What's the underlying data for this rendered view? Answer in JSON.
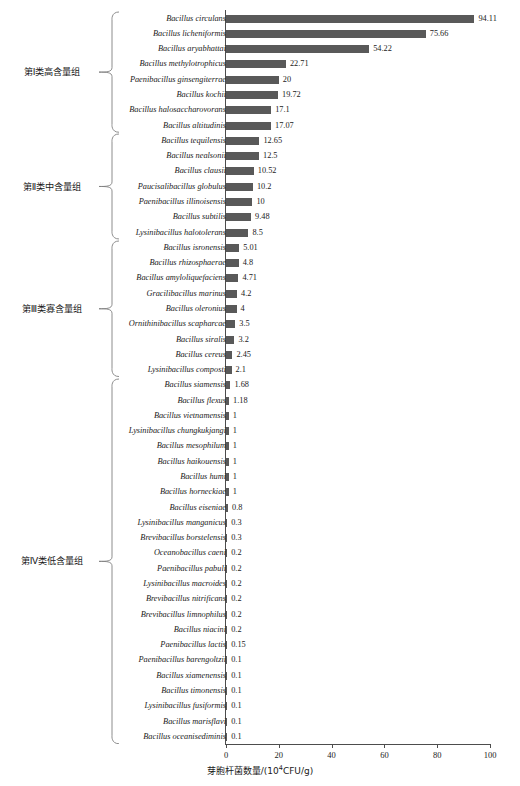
{
  "chart_data": {
    "type": "bar",
    "orientation": "horizontal",
    "title": "",
    "xlabel": "芽胞杆菌数量/(10⁴CFU/g)",
    "ylabel": "",
    "xlim": [
      0,
      100
    ],
    "xticks": [
      0,
      20,
      40,
      60,
      80,
      100
    ],
    "xtick_labels": [
      "0",
      "20",
      "40",
      "60",
      "80",
      "100"
    ],
    "grid": false,
    "legend": false,
    "bar_color": "#595959",
    "axis_color": "#4d4d4d",
    "categories": [
      "Bacillus circulans",
      "Bacillus licheniformis",
      "Bacillus aryabhattai",
      "Bacillus methylotrophicus",
      "Paenibacillus ginsengiterrae",
      "Bacillus kochii",
      "Bacillus halosaccharovorans",
      "Bacillus altitudinis",
      "Bacillus tequilensis",
      "Bacillus nealsonii",
      "Bacillus clausii",
      "Paucisalibacillus globulus",
      "Paenibacillus illinoisensis",
      "Bacillus subtilis",
      "Lysinibacillus halotolerans",
      "Bacillus isronensis",
      "Bacillus rhizosphaerae",
      "Bacillus amyloliquefaciens",
      "Gracilibacillus marinus",
      "Bacillus oleronius",
      "Ornithinibacillus scapharcae",
      "Bacillus siralis",
      "Bacillus cereus",
      "Lysinibacillus composti",
      "Bacillus siamensis",
      "Bacillus flexus",
      "Bacillus vietnamensis",
      "Lysinibacillus chungkukjangi",
      "Bacillus mesophilum",
      "Bacillus haikouensis",
      "Bacillus humi",
      "Bacillus horneckiae",
      "Bacillus eiseniae",
      "Lysinibacillus manganicus",
      "Brevibacillus borstelensis",
      "Oceanobacillus caeni",
      "Paenibacillus pabuli",
      "Lysinibacillus macroides",
      "Brevibacillus nitrificans",
      "Brevibacillus limnophilus",
      "Bacillus niacini",
      "Paenibacillus lactis",
      "Paenibacillus barengoltzii",
      "Bacillus xiamenensis",
      "Bacillus timonensis",
      "Lysinibacillus fusiformis",
      "Bacillus marisflavi",
      "Bacillus oceanisediminis"
    ],
    "values": [
      94.11,
      75.66,
      54.22,
      22.71,
      20,
      19.72,
      17.1,
      17.07,
      12.65,
      12.5,
      10.52,
      10.2,
      10,
      9.48,
      8.5,
      5.01,
      4.8,
      4.71,
      4.2,
      4,
      3.5,
      3.2,
      2.45,
      2.1,
      1.68,
      1.18,
      1,
      1,
      1,
      1,
      1,
      1,
      0.8,
      0.3,
      0.3,
      0.2,
      0.2,
      0.2,
      0.2,
      0.2,
      0.2,
      0.15,
      0.1,
      0.1,
      0.1,
      0.1,
      0.1,
      0.1
    ],
    "value_labels": [
      "94.11",
      "75.66",
      "54.22",
      "22.71",
      "20",
      "19.72",
      "17.1",
      "17.07",
      "12.65",
      "12.5",
      "10.52",
      "10.2",
      "10",
      "9.48",
      "8.5",
      "5.01",
      "4.8",
      "4.71",
      "4.2",
      "4",
      "3.5",
      "3.2",
      "2.45",
      "2.1",
      "1.68",
      "1.18",
      "1",
      "1",
      "1",
      "1",
      "1",
      "1",
      "0.8",
      "0.3",
      "0.3",
      "0.2",
      "0.2",
      "0.2",
      "0.2",
      "0.2",
      "0.2",
      "0.15",
      "0.1",
      "0.1",
      "0.1",
      "0.1",
      "0.1",
      "0.1"
    ],
    "groups": [
      {
        "label": "第Ⅰ类高含量组",
        "start_index": 0,
        "end_index": 7
      },
      {
        "label": "第Ⅱ类中含量组",
        "start_index": 8,
        "end_index": 14
      },
      {
        "label": "第Ⅲ类寡含量组",
        "start_index": 15,
        "end_index": 23
      },
      {
        "label": "第Ⅳ类低含量组",
        "start_index": 24,
        "end_index": 47
      }
    ]
  }
}
